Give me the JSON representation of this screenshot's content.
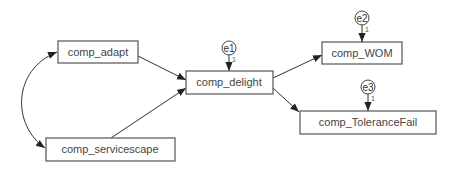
{
  "diagram": {
    "type": "path-model",
    "nodes": {
      "adapt": {
        "label": "comp_adapt"
      },
      "servicescape": {
        "label": "comp_servicescape"
      },
      "delight": {
        "label": "comp_delight"
      },
      "wom": {
        "label": "comp_WOM"
      },
      "tolerance": {
        "label": "comp_ToleranceFail"
      }
    },
    "errors": {
      "e1": {
        "label": "e1",
        "weight": "1",
        "target": "comp_delight"
      },
      "e2": {
        "label": "e2",
        "weight": "1",
        "target": "comp_WOM"
      },
      "e3": {
        "label": "e3",
        "weight": "1",
        "target": "comp_ToleranceFail"
      }
    },
    "edges": [
      {
        "from": "comp_adapt",
        "to": "comp_delight",
        "kind": "directed"
      },
      {
        "from": "comp_servicescape",
        "to": "comp_delight",
        "kind": "directed"
      },
      {
        "from": "comp_delight",
        "to": "comp_WOM",
        "kind": "directed"
      },
      {
        "from": "comp_delight",
        "to": "comp_ToleranceFail",
        "kind": "directed"
      },
      {
        "from": "comp_adapt",
        "to": "comp_servicescape",
        "kind": "covariance"
      }
    ],
    "colors": {
      "stroke": "#555555",
      "text": "#444444",
      "background": "#ffffff"
    }
  }
}
